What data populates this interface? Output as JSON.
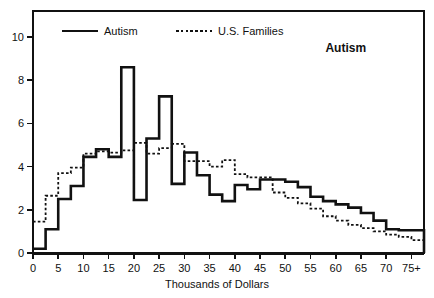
{
  "chart_data": {
    "type": "line",
    "title": "",
    "xlabel": "Thousands of Dollars",
    "ylabel": "",
    "xlim": [
      0,
      77.5
    ],
    "ylim": [
      0,
      11.2
    ],
    "grid": false,
    "legend_position": "top-left inside",
    "step_mode": "post",
    "xticks": [
      0,
      5,
      10,
      15,
      20,
      25,
      30,
      35,
      40,
      45,
      50,
      55,
      60,
      65,
      70,
      75
    ],
    "xtick_labels": [
      "0",
      "5",
      "10",
      "15",
      "20",
      "25",
      "30",
      "35",
      "40",
      "45",
      "50",
      "55",
      "60",
      "65",
      "70",
      "75+"
    ],
    "yticks": [
      0,
      2,
      4,
      6,
      8,
      10
    ],
    "ytick_labels": [
      "0",
      "2",
      "4",
      "6",
      "8",
      "10"
    ],
    "annotations": [
      {
        "text": "Autism",
        "x": 62,
        "y": 9.3,
        "bold": true
      }
    ],
    "series": [
      {
        "name": "Autism",
        "style": "solid",
        "color": "#111111",
        "width": 2.6,
        "x": [
          0,
          1,
          2.5,
          5,
          7.5,
          10,
          12.5,
          15,
          17.5,
          20,
          22.5,
          25,
          27.5,
          30,
          32.5,
          35,
          37.5,
          40,
          42.5,
          45,
          47.5,
          50,
          52.5,
          55,
          57.5,
          60,
          62.5,
          65,
          67.5,
          70,
          72.5,
          75,
          77.5
        ],
        "values": [
          0.2,
          0.2,
          1.1,
          2.5,
          3.1,
          4.45,
          4.8,
          4.45,
          8.6,
          2.45,
          5.3,
          7.25,
          3.2,
          4.65,
          3.6,
          2.7,
          2.4,
          3.15,
          2.95,
          3.4,
          3.4,
          3.3,
          3.05,
          2.6,
          2.4,
          2.25,
          2.1,
          1.85,
          1.5,
          1.1,
          1.05,
          1.05,
          0.0
        ]
      },
      {
        "name": "U.S. Families",
        "style": "dotted",
        "color": "#111111",
        "width": 1.8,
        "x": [
          0,
          1,
          2.5,
          5,
          7.5,
          10,
          12.5,
          15,
          17.5,
          20,
          22.5,
          25,
          27.5,
          30,
          32.5,
          35,
          37.5,
          40,
          42.5,
          45,
          47.5,
          50,
          52.5,
          55,
          57.5,
          60,
          62.5,
          65,
          67.5,
          70,
          72.5,
          75,
          77.5
        ],
        "values": [
          1.45,
          1.45,
          2.65,
          3.7,
          3.95,
          4.6,
          4.7,
          4.65,
          4.75,
          5.1,
          4.6,
          4.85,
          5.05,
          4.25,
          4.25,
          4.0,
          4.3,
          3.65,
          3.5,
          3.5,
          2.8,
          2.55,
          2.3,
          2.05,
          1.7,
          1.5,
          1.3,
          1.15,
          1.0,
          0.85,
          0.75,
          0.6,
          0.6
        ]
      }
    ]
  },
  "legend": {
    "items": [
      {
        "label": "Autism",
        "style": "solid"
      },
      {
        "label": "U.S. Families",
        "style": "dotted"
      }
    ]
  }
}
